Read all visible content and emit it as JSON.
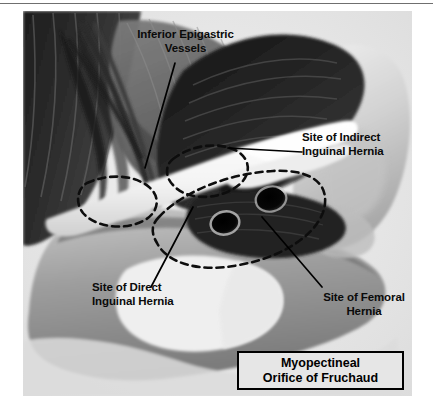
{
  "figure": {
    "type": "anatomical-illustration",
    "subject": "Myopectineal Orifice of Fruchaud",
    "background_color": "#e3e3e3",
    "caption": {
      "line1": "Myopectineal",
      "line2": "Orifice of Fruchaud",
      "border_color": "#000000"
    },
    "labels": [
      {
        "id": "inferior-epigastric-vessels",
        "line1": "Inferior Epigastric",
        "line2": "Vessels",
        "align": "center"
      },
      {
        "id": "site-of-indirect-inguinal-hernia",
        "line1": "Site of Indirect",
        "line2": "Inguinal Hernia",
        "align": "left"
      },
      {
        "id": "site-of-direct-inguinal-hernia",
        "line1": "Site of Direct",
        "line2": "Inguinal Hernia",
        "align": "left"
      },
      {
        "id": "site-of-femoral-hernia",
        "line1": "Site of Femoral",
        "line2": "Hernia",
        "align": "center"
      }
    ],
    "structures": [
      {
        "id": "internal-oblique-muscle",
        "tone": "#2a2a2a"
      },
      {
        "id": "transversus-abdominis-muscle",
        "tone": "#6b6b6b"
      },
      {
        "id": "rectus-abdominis-muscle",
        "tone": "#3a3a3a"
      },
      {
        "id": "iliac-crest-bone",
        "tone": "#d6d6d6"
      },
      {
        "id": "pubic-bone",
        "tone": "#9b9b9b"
      },
      {
        "id": "obturator-foramen",
        "tone": "#ededed"
      },
      {
        "id": "inguinal-ligament",
        "tone": "#f2f2f2"
      },
      {
        "id": "spermatic-cord",
        "tone": "#f5f5f5"
      },
      {
        "id": "femoral-artery-opening",
        "tone": "#050505"
      },
      {
        "id": "femoral-vein-opening",
        "tone": "#050505"
      }
    ],
    "hernia_site_outlines": [
      {
        "id": "direct-hernia-dashed-outline",
        "style": "dashed"
      },
      {
        "id": "indirect-hernia-dashed-outline",
        "style": "dashed"
      },
      {
        "id": "femoral-hernia-dashed-outline",
        "style": "dashed"
      }
    ]
  }
}
